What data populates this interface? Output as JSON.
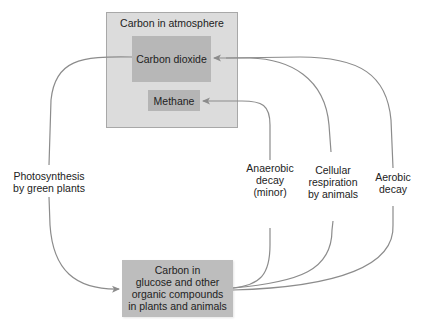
{
  "diagram": {
    "atmosphere": {
      "title": "Carbon in atmosphere",
      "carbon_dioxide": "Carbon dioxide",
      "methane": "Methane"
    },
    "organisms": {
      "lines": [
        "Carbon in",
        "glucose and other",
        "organic compounds",
        "in plants and animals"
      ]
    },
    "processes": {
      "photosynthesis": [
        "Photosynthesis",
        "by green plants"
      ],
      "anaerobic": [
        "Anaerobic",
        "decay",
        "(minor)"
      ],
      "respiration": [
        "Cellular",
        "respiration",
        "by animals"
      ],
      "aerobic": [
        "Aerobic",
        "decay"
      ]
    },
    "colors": {
      "arrow": "#8c8c8c",
      "outer_box": "#dcdcdc",
      "inner_box": "#b7b7b7"
    }
  }
}
